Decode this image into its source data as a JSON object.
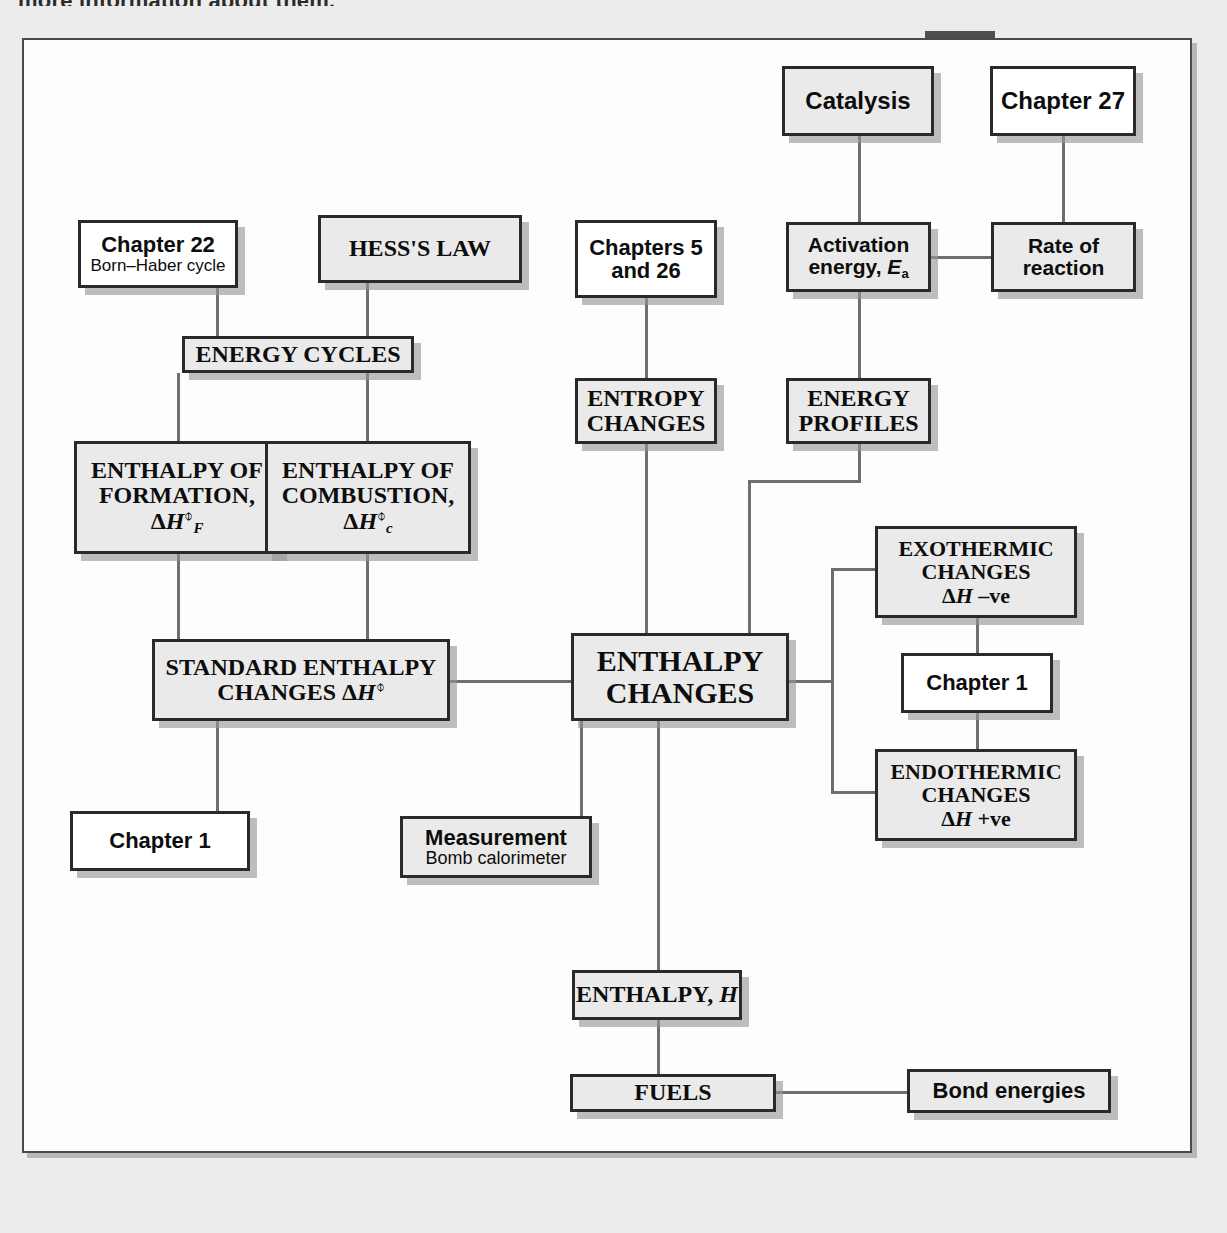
{
  "page": {
    "cut_off_text": "more information about them."
  },
  "diagram": {
    "colors": {
      "box_fill_gray": "#ececec",
      "box_fill_white": "#ffffff",
      "border": "#2a2a2a",
      "connector": "#6f6f6f",
      "shadow": "#969696",
      "page_background": "#ececec"
    },
    "nodes": [
      {
        "id": "catalysis",
        "label": "Catalysis",
        "fill": "gray",
        "font": "sans",
        "size": "t24"
      },
      {
        "id": "chapter27",
        "label": "Chapter 27",
        "fill": "white",
        "font": "sans",
        "size": "t24"
      },
      {
        "id": "chapter22",
        "label": "Chapter 22",
        "subtitle": "Born–Haber cycle",
        "fill": "white",
        "font": "sans",
        "size": "t22"
      },
      {
        "id": "hess",
        "label": "HESS'S LAW",
        "fill": "gray",
        "font": "serif",
        "size": "t24"
      },
      {
        "id": "chapters5and26",
        "label": "Chapters 5",
        "label2": "and 26",
        "fill": "white",
        "font": "sans",
        "size": "t22"
      },
      {
        "id": "activation",
        "label": "Activation",
        "label2": "energy, Ea",
        "fill": "gray",
        "font": "sans",
        "size": "t21"
      },
      {
        "id": "rate",
        "label": "Rate of",
        "label2": "reaction",
        "fill": "gray",
        "font": "sans",
        "size": "t21"
      },
      {
        "id": "energycycles",
        "label": "ENERGY CYCLES",
        "fill": "gray",
        "font": "serif",
        "size": "t24"
      },
      {
        "id": "entropy",
        "label": "ENTROPY",
        "label2": "CHANGES",
        "fill": "gray",
        "font": "serif",
        "size": "t24"
      },
      {
        "id": "energyprofiles",
        "label": "ENERGY",
        "label2": "PROFILES",
        "fill": "gray",
        "font": "serif",
        "size": "t24"
      },
      {
        "id": "enthalpyformation",
        "label": "ENTHALPY OF",
        "label2": "FORMATION,",
        "label3": "ΔH⊖F",
        "fill": "gray",
        "font": "serif",
        "size": "t24"
      },
      {
        "id": "enthalpycombustion",
        "label": "ENTHALPY OF",
        "label2": "COMBUSTION,",
        "label3": "ΔH⊖c",
        "fill": "gray",
        "font": "serif",
        "size": "t24"
      },
      {
        "id": "exothermic",
        "label": "EXOTHERMIC",
        "label2": "CHANGES",
        "label3": "ΔH –ve",
        "fill": "gray",
        "font": "serif",
        "size": "t22"
      },
      {
        "id": "standardenthalpy",
        "label": "STANDARD ENTHALPY",
        "label2": "CHANGES ΔH⊖",
        "fill": "gray",
        "font": "serif",
        "size": "t24"
      },
      {
        "id": "enthalpychanges",
        "label": "ENTHALPY",
        "label2": "CHANGES",
        "fill": "gray",
        "font": "serif",
        "size": "t30"
      },
      {
        "id": "chapter1right",
        "label": "Chapter 1",
        "fill": "white",
        "font": "sans",
        "size": "t22"
      },
      {
        "id": "endothermic",
        "label": "ENDOTHERMIC",
        "label2": "CHANGES",
        "label3": "ΔH +ve",
        "fill": "gray",
        "font": "serif",
        "size": "t22"
      },
      {
        "id": "chapter1left",
        "label": "Chapter 1",
        "fill": "white",
        "font": "sans",
        "size": "t22"
      },
      {
        "id": "measurement",
        "label": "Measurement",
        "subtitle": "Bomb calorimeter",
        "fill": "gray",
        "font": "sans",
        "size": "t22"
      },
      {
        "id": "enthalpyH",
        "label": "ENTHALPY, H",
        "fill": "gray",
        "font": "serif",
        "size": "t24"
      },
      {
        "id": "fuels",
        "label": "FUELS",
        "fill": "gray",
        "font": "serif",
        "size": "t24"
      },
      {
        "id": "bondenergies",
        "label": "Bond energies",
        "fill": "gray",
        "font": "sans",
        "size": "t22"
      }
    ],
    "edges": [
      {
        "from": "catalysis",
        "to": "activation"
      },
      {
        "from": "chapter27",
        "to": "rate"
      },
      {
        "from": "activation",
        "to": "rate"
      },
      {
        "from": "activation",
        "to": "energyprofiles"
      },
      {
        "from": "chapter22",
        "to": "energycycles"
      },
      {
        "from": "hess",
        "to": "energycycles"
      },
      {
        "from": "energycycles",
        "to": "enthalpyformation"
      },
      {
        "from": "energycycles",
        "to": "enthalpycombustion"
      },
      {
        "from": "chapters5and26",
        "to": "entropy"
      },
      {
        "from": "entropy",
        "to": "enthalpychanges"
      },
      {
        "from": "energyprofiles",
        "to": "enthalpychanges"
      },
      {
        "from": "enthalpyformation",
        "to": "standardenthalpy"
      },
      {
        "from": "enthalpycombustion",
        "to": "standardenthalpy"
      },
      {
        "from": "standardenthalpy",
        "to": "enthalpychanges"
      },
      {
        "from": "standardenthalpy",
        "to": "chapter1left"
      },
      {
        "from": "enthalpychanges",
        "to": "exothermic"
      },
      {
        "from": "enthalpychanges",
        "to": "endothermic"
      },
      {
        "from": "exothermic",
        "to": "chapter1right"
      },
      {
        "from": "chapter1right",
        "to": "endothermic"
      },
      {
        "from": "enthalpychanges",
        "to": "measurement"
      },
      {
        "from": "enthalpychanges",
        "to": "enthalpyH"
      },
      {
        "from": "enthalpyH",
        "to": "fuels"
      },
      {
        "from": "fuels",
        "to": "bondenergies"
      }
    ]
  }
}
